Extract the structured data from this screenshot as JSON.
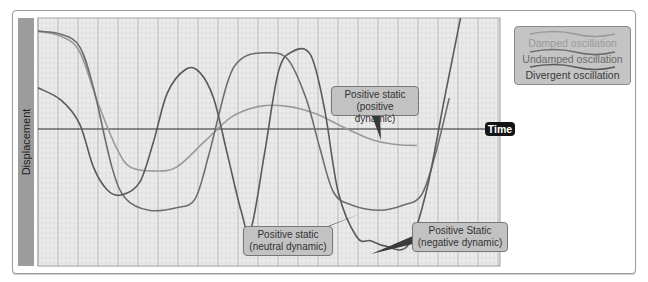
{
  "chart_data": {
    "type": "line",
    "title": "",
    "xlabel": "Time",
    "ylabel": "Displacement",
    "grid": true,
    "legend_position": "top-right",
    "x_range": [
      0,
      100
    ],
    "y_range": [
      -1,
      1
    ],
    "series": [
      {
        "name": "Damped oscillation",
        "color": "#9a9a9a",
        "points": [
          [
            0,
            0.95
          ],
          [
            5,
            0.9
          ],
          [
            9,
            0.75
          ],
          [
            13,
            0.25
          ],
          [
            17,
            -0.15
          ],
          [
            20,
            -0.3
          ],
          [
            25,
            -0.33
          ],
          [
            30,
            -0.3
          ],
          [
            36,
            -0.1
          ],
          [
            42,
            0.12
          ],
          [
            48,
            0.22
          ],
          [
            54,
            0.22
          ],
          [
            60,
            0.15
          ],
          [
            66,
            0.02
          ],
          [
            72,
            -0.08
          ],
          [
            77,
            -0.12
          ],
          [
            82,
            -0.13
          ]
        ]
      },
      {
        "name": "Undamped oscillation",
        "color": "#6e6e6e",
        "points": [
          [
            0,
            0.95
          ],
          [
            5,
            0.92
          ],
          [
            9,
            0.8
          ],
          [
            12,
            0.4
          ],
          [
            16,
            -0.3
          ],
          [
            19,
            -0.55
          ],
          [
            24,
            -0.64
          ],
          [
            30,
            -0.62
          ],
          [
            34,
            -0.55
          ],
          [
            37,
            -0.2
          ],
          [
            41,
            0.45
          ],
          [
            44,
            0.68
          ],
          [
            49,
            0.74
          ],
          [
            54,
            0.68
          ],
          [
            58,
            0.3
          ],
          [
            61,
            -0.15
          ],
          [
            64,
            -0.5
          ],
          [
            68,
            -0.6
          ],
          [
            74,
            -0.64
          ],
          [
            79,
            -0.6
          ],
          [
            83,
            -0.52
          ],
          [
            86,
            -0.2
          ],
          [
            89,
            0.3
          ]
        ]
      },
      {
        "name": "Divergent oscillation",
        "color": "#5a5a5a",
        "points": [
          [
            0,
            0.4
          ],
          [
            5,
            0.28
          ],
          [
            9,
            0.05
          ],
          [
            12,
            -0.3
          ],
          [
            15,
            -0.48
          ],
          [
            18,
            -0.52
          ],
          [
            22,
            -0.42
          ],
          [
            25,
            -0.1
          ],
          [
            28,
            0.35
          ],
          [
            32,
            0.58
          ],
          [
            35,
            0.55
          ],
          [
            38,
            0.3
          ],
          [
            41,
            -0.2
          ],
          [
            44,
            -0.65
          ],
          [
            46,
            -0.8
          ],
          [
            49,
            -0.2
          ],
          [
            52,
            0.55
          ],
          [
            55,
            0.75
          ],
          [
            59,
            0.72
          ],
          [
            62,
            0.2
          ],
          [
            65,
            -0.5
          ],
          [
            69,
            -0.85
          ],
          [
            72,
            -0.88
          ],
          [
            75,
            -0.92
          ],
          [
            80,
            -0.92
          ],
          [
            84,
            -0.5
          ],
          [
            88,
            0.3
          ],
          [
            92,
            1.2
          ]
        ]
      }
    ],
    "annotations": [
      {
        "text_line1": "Positive static",
        "text_line2": "(positive dynamic)",
        "target_series": "Damped oscillation"
      },
      {
        "text_line1": "Positive static",
        "text_line2": "(neutral dynamic)",
        "target_series": "Undamped oscillation"
      },
      {
        "text_line1": "Positive Static",
        "text_line2": "(negative dynamic)",
        "target_series": "Divergent oscillation"
      }
    ]
  },
  "labels": {
    "ylabel": "Displacement",
    "time": "Time",
    "legend": [
      "Damped oscillation",
      "Undamped oscillation",
      "Divergent oscillation"
    ],
    "callout_positive": [
      "Positive static",
      "(positive dynamic)"
    ],
    "callout_neutral": [
      "Positive static",
      "(neutral dynamic)"
    ],
    "callout_negative": [
      "Positive Static",
      "(negative dynamic)"
    ]
  },
  "colors": {
    "damped": "#9a9a9a",
    "undamped": "#6e6e6e",
    "divergent": "#5a5a5a",
    "axis": "#2a2a2a",
    "grid_minor": "#d6d6d6",
    "grid_major": "#a8a8a8",
    "plot_bg": "#ececec"
  }
}
